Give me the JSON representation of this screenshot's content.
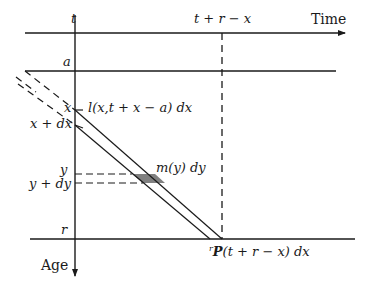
{
  "diagram": {
    "type": "lexis-diagram",
    "axes": {
      "time_label": "Time",
      "age_label": "Age",
      "t_label": "t",
      "t_plus_r_minus_x_label": "t + r − x"
    },
    "age_marks": {
      "a": "a",
      "x": "x",
      "x_plus_dx": "x + dx",
      "y": "y",
      "y_plus_dy": "y + dy",
      "r": "r"
    },
    "annotations": {
      "l_expr": "l(x,t + x − a) dx",
      "m_expr": "m(y) dy",
      "P_super": "r",
      "P_symbol": "P",
      "P_expr": "(t + r − x) dx"
    },
    "colors": {
      "line": "#1a1a1a",
      "shaded_region": "#808080",
      "background": "#ffffff"
    }
  }
}
